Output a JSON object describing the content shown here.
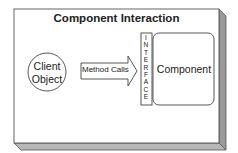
{
  "diagram": {
    "title": "Component Interaction",
    "client": {
      "line1": "Client",
      "line2": "Object"
    },
    "arrow": {
      "label": "Method Calls"
    },
    "interface": {
      "letters": [
        "I",
        "N",
        "T",
        "E",
        "R",
        "F",
        "A",
        "C",
        "E"
      ]
    },
    "component": {
      "label": "Component"
    }
  },
  "colors": {
    "stroke": "#444444",
    "box_side": "#9a9a9a",
    "box_bottom": "#b8b8b8",
    "background": "#ffffff"
  }
}
